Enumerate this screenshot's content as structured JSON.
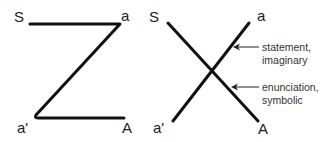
{
  "diagram": {
    "schema_z": {
      "labels": {
        "top_left": "S",
        "top_right": "a",
        "bottom_left": "a'",
        "bottom_right": "A"
      }
    },
    "schema_x": {
      "labels": {
        "top_left": "S",
        "top_right": "a",
        "bottom_left": "a'",
        "bottom_right": "A"
      },
      "annotations": [
        {
          "line1": "statement,",
          "line2": "imaginary"
        },
        {
          "line1": "enunciation,",
          "line2": "symbolic"
        }
      ]
    },
    "colors": {
      "line": "#111111",
      "text": "#222222",
      "background": "#ffffff"
    }
  }
}
